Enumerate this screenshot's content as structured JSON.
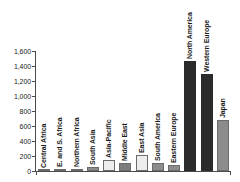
{
  "chart_data": {
    "type": "bar",
    "title": "",
    "subtitle": "",
    "xlabel": "",
    "ylabel": "",
    "ylim": [
      0,
      1600
    ],
    "grid": false,
    "legend": "none",
    "y_ticks": [
      "0",
      "200",
      "400",
      "600",
      "800",
      "1,000",
      "1,200",
      "1,400",
      "1,600"
    ],
    "y_tick_values": [
      0,
      200,
      400,
      600,
      800,
      1000,
      1200,
      1400,
      1600
    ],
    "categories": [
      "Central Africa",
      "E. and S. Africa",
      "Northern Africa",
      "South Asia",
      "Asia-Pacific",
      "Middle East",
      "East Asia",
      "South America",
      "Eastern Europe",
      "North America",
      "Western Europe",
      "Japan"
    ],
    "values": [
      10,
      25,
      30,
      60,
      150,
      110,
      220,
      110,
      85,
      1470,
      1290,
      680
    ],
    "bar_colors": [
      "#e8e8e8",
      "#8c8c8c",
      "#e8e8e8",
      "#8c8c8c",
      "#ededed",
      "#7d7d7d",
      "#ededed",
      "#8c8c8c",
      "#8c8c8c",
      "#2b2b2b",
      "#2b2b2b",
      "#8c8c8c"
    ]
  },
  "colors": {
    "axis": "#4a4a4a",
    "text": "#1a1a1a",
    "background": "#ffffff",
    "bar_light": "#e8e8e8",
    "bar_medium": "#8c8c8c",
    "bar_dark": "#2b2b2b"
  }
}
